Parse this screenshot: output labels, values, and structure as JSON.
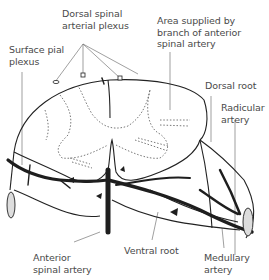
{
  "diagram": {
    "labels": {
      "dorsal_spinal_arterial_plexus": "Dorsal spinal\narterial plexus",
      "surface_pial_plexus": "Surface pial\nplexus",
      "area_supplied": "Area supplied by\nbranch of anterior\nspinal artery",
      "dorsal_root": "Dorsal root",
      "radicular_artery": "Radicular\nartery",
      "anterior_spinal_artery": "Anterior\nspinal artery",
      "ventral_root": "Ventral root",
      "medullary_artery": "Medullary\nartery"
    },
    "colors": {
      "line": "#222222",
      "vessel": "#1e1e1e",
      "label_text": "#4a4a4a",
      "leader_line": "#777777",
      "background": "#ffffff"
    }
  }
}
